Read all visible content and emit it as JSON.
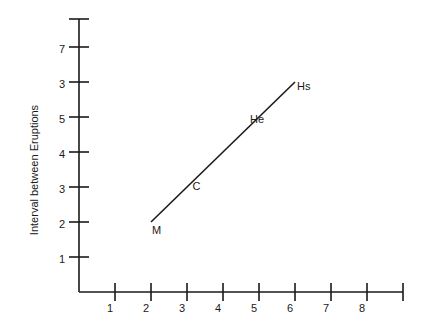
{
  "chart_data": {
    "type": "line",
    "title": "",
    "xlabel": "",
    "ylabel": "Interval between Eruptions",
    "xlim": [
      0,
      9
    ],
    "ylim": [
      0,
      7.8
    ],
    "x_ticks": [
      1,
      2,
      3,
      4,
      5,
      6,
      7,
      8,
      9
    ],
    "x_tick_labels": [
      "1",
      "2",
      "3",
      "4",
      "5",
      "6",
      "7",
      "8",
      ""
    ],
    "y_ticks": [
      1,
      2,
      3,
      4,
      5,
      6,
      7,
      7.8
    ],
    "y_tick_labels": [
      "1",
      "2",
      "3",
      "4",
      "5",
      "3",
      "7",
      ""
    ],
    "grid": false,
    "legend": "none",
    "series": [
      {
        "name": "eruption trend",
        "points": [
          {
            "x": 2,
            "y": 2,
            "label": "M"
          },
          {
            "x": 3.1,
            "y": 3.1,
            "label": "C"
          },
          {
            "x": 5,
            "y": 5,
            "label": "He"
          },
          {
            "x": 6,
            "y": 6,
            "label": "Hs"
          }
        ]
      }
    ]
  }
}
